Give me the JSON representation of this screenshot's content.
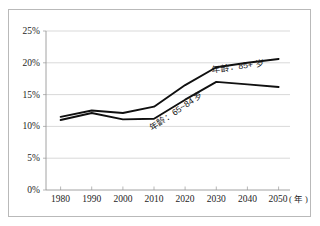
{
  "figure": {
    "background_color": "#ffffff",
    "frame_color": "#b9b9b9",
    "plot_bg_color": "#ffffff"
  },
  "axes": {
    "y_ticks": [
      "0%",
      "5%",
      "10%",
      "15%",
      "20%",
      "25%"
    ],
    "x_ticks": [
      "1980",
      "1990",
      "2000",
      "2010",
      "2020",
      "2030",
      "2040",
      "2050"
    ],
    "x_unit_label": "( 年 )",
    "grid_color": "#c9c9c9",
    "axis_color": "#8a8a8a"
  },
  "series_labels": {
    "upper": "年龄：85+ 岁",
    "lower": "年龄：65~84 岁"
  },
  "chart_data": {
    "type": "line",
    "title": "",
    "xlabel": "( 年 )",
    "ylabel": "",
    "x": [
      1980,
      1990,
      2000,
      2010,
      2020,
      2030,
      2040,
      2050
    ],
    "categories": [
      "1980",
      "1990",
      "2000",
      "2010",
      "2020",
      "2030",
      "2040",
      "2050"
    ],
    "ylim": [
      0,
      25
    ],
    "xlim": [
      1980,
      2050
    ],
    "y_tick_values": [
      0,
      5,
      10,
      15,
      20,
      25
    ],
    "y_tick_labels": [
      "0%",
      "5%",
      "10%",
      "15%",
      "20%",
      "25%"
    ],
    "grid": true,
    "grid_axis": "y",
    "legend": "inline-annotations",
    "units": "percent",
    "series": [
      {
        "name": "年龄：85+ 岁",
        "color": "#101010",
        "values": [
          11.5,
          12.5,
          12.1,
          13.1,
          16.5,
          19.3,
          20.0,
          20.6
        ]
      },
      {
        "name": "年龄：65~84 岁",
        "color": "#101010",
        "values": [
          11.0,
          12.1,
          11.1,
          11.2,
          14.2,
          17.0,
          16.6,
          16.2
        ]
      }
    ],
    "annotations": [
      {
        "text": "年龄：85+ 岁",
        "near_x": 2035,
        "near_y": 18.8,
        "rotation": -8
      },
      {
        "text": "年龄：65~84 岁",
        "near_x": 2022,
        "near_y": 11.6,
        "rotation": -34
      }
    ]
  }
}
